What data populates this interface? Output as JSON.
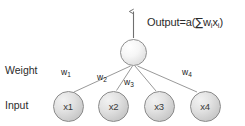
{
  "diagram": {
    "title_text": "",
    "background_color": "#ffffff",
    "row_labels": [
      {
        "name": "weight-row-label",
        "text": "Weight",
        "x": 5,
        "y": 64
      },
      {
        "name": "input-row-label",
        "text": "Input",
        "x": 5,
        "y": 99
      }
    ],
    "output_neuron": {
      "label": "",
      "cx": 133.5,
      "cy": 52.5,
      "r": 13.5,
      "fill_light": "#ffffff",
      "fill_dark": "#d2d2d2",
      "stroke": "#8f8f8f"
    },
    "output_arrow": {
      "name": "output-arrow",
      "x": 133.5,
      "y_start": 38,
      "y_end": 10,
      "color": "#6f6f6f"
    },
    "output_formula": {
      "prefix": "Output=a(",
      "sigma": "∑",
      "w": "w",
      "w_sub": "i",
      "x": "x",
      "x_sub": "i",
      "suffix": ")",
      "full_text": "Output=a(∑wᵢxᵢ)",
      "pos_x": 147,
      "pos_y": 15
    },
    "input_nodes": [
      {
        "name": "input-node-x1",
        "label": "x1",
        "cx": 68,
        "cy": 106
      },
      {
        "name": "input-node-x2",
        "label": "x2",
        "cx": 113.5,
        "cy": 106
      },
      {
        "name": "input-node-x3",
        "label": "x3",
        "cx": 159,
        "cy": 106
      },
      {
        "name": "input-node-x4",
        "label": "x4",
        "cx": 205,
        "cy": 106
      }
    ],
    "input_node_style": {
      "r": 15.5,
      "fill_light": "#f2f2f2",
      "fill_dark": "#bdbdbd",
      "stroke": "#8a8a8a"
    },
    "weights": [
      {
        "name": "weight-label-w1",
        "symbol": "w",
        "subscript": "1",
        "text": "w1",
        "pos_x": 61,
        "pos_y": 67
      },
      {
        "name": "weight-label-w2",
        "symbol": "w",
        "subscript": "2",
        "text": "w2",
        "pos_x": 97,
        "pos_y": 72
      },
      {
        "name": "weight-label-w3",
        "symbol": "w",
        "subscript": "3",
        "text": "w3",
        "pos_x": 124,
        "pos_y": 77
      },
      {
        "name": "weight-label-w4",
        "symbol": "w",
        "subscript": "4",
        "text": "w4",
        "pos_x": 182,
        "pos_y": 67
      }
    ],
    "edges": [
      {
        "name": "edge-x1-to-output",
        "x1": 74,
        "y1": 92,
        "x2": 130,
        "y2": 66
      },
      {
        "name": "edge-x2-to-output",
        "x1": 116,
        "y1": 90,
        "x2": 132,
        "y2": 66
      },
      {
        "name": "edge-x3-to-output",
        "x1": 156,
        "y1": 91,
        "x2": 135,
        "y2": 66
      },
      {
        "name": "edge-x4-to-output",
        "x1": 197,
        "y1": 92,
        "x2": 138,
        "y2": 66
      }
    ],
    "edge_color": "#8d8d8d",
    "edge_width": 0.9
  }
}
